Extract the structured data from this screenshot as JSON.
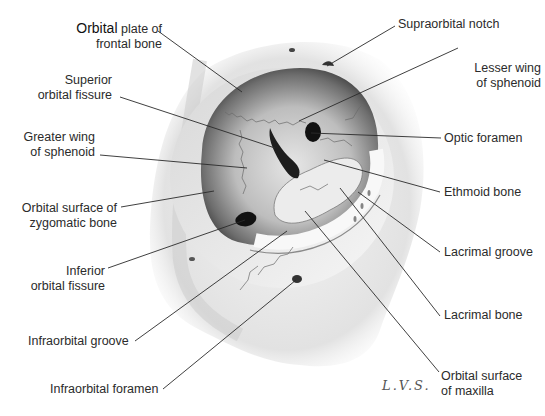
{
  "figure": {
    "signature": "L.V.S."
  },
  "labels_left": [
    {
      "id": "orbital-plate",
      "lines": [
        "Orbital plate of",
        "frontal bone"
      ],
      "emphasis": "Orbital"
    },
    {
      "id": "superior-orbital-fissure",
      "lines": [
        "Superior",
        "orbital fissure"
      ]
    },
    {
      "id": "greater-wing",
      "lines": [
        "Greater wing",
        "of sphenoid"
      ]
    },
    {
      "id": "zygomatic-surface",
      "lines": [
        "Orbital surface of",
        "zygomatic bone"
      ]
    },
    {
      "id": "inferior-orbital-fissure",
      "lines": [
        "Inferior",
        "orbital fissure"
      ]
    },
    {
      "id": "infraorbital-groove",
      "lines": [
        "Infraorbital groove"
      ]
    },
    {
      "id": "infraorbital-foramen",
      "lines": [
        "Infraorbital foramen"
      ]
    }
  ],
  "labels_right": [
    {
      "id": "supraorbital-notch",
      "lines": [
        "Supraorbital notch"
      ]
    },
    {
      "id": "lesser-wing",
      "lines": [
        "Lesser wing",
        "of sphenoid"
      ]
    },
    {
      "id": "optic-foramen",
      "lines": [
        "Optic foramen"
      ]
    },
    {
      "id": "ethmoid-bone",
      "lines": [
        "Ethmoid bone"
      ]
    },
    {
      "id": "lacrimal-groove",
      "lines": [
        "Lacrimal groove"
      ]
    },
    {
      "id": "lacrimal-bone",
      "lines": [
        "Lacrimal bone"
      ]
    },
    {
      "id": "maxilla-surface",
      "lines": [
        "Orbital surface",
        "of maxilla"
      ]
    }
  ],
  "orbital_plate_rest": " plate of"
}
